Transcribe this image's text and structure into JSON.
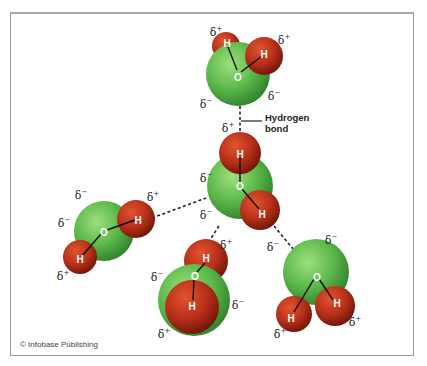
{
  "diagram": {
    "annotation": {
      "line1": "Hydrogen",
      "line2": "bond"
    },
    "credit": "© Infobase Publishing",
    "colors": {
      "oxygen": "#5cb84a",
      "hydrogen": "#b8301a",
      "bond_line": "#222222",
      "frame": "#9a9a9a"
    },
    "symbols": {
      "oxygen": "O",
      "hydrogen": "H",
      "delta_plus": "δ+",
      "delta_minus": "δ−"
    },
    "molecules": [
      {
        "id": "top",
        "atoms": [
          "O",
          "H",
          "H"
        ],
        "charges": [
          "δ+",
          "δ+",
          "δ−",
          "δ−"
        ]
      },
      {
        "id": "center",
        "atoms": [
          "O",
          "H",
          "H"
        ],
        "charges": [
          "δ+",
          "δ−",
          "δ−"
        ]
      },
      {
        "id": "left",
        "atoms": [
          "O",
          "H",
          "H"
        ],
        "charges": [
          "δ−",
          "δ+",
          "δ−",
          "δ+"
        ]
      },
      {
        "id": "bottom",
        "atoms": [
          "O",
          "H",
          "H"
        ],
        "charges": [
          "δ−",
          "δ+",
          "δ−",
          "δ+"
        ]
      },
      {
        "id": "right",
        "atoms": [
          "O",
          "H",
          "H"
        ],
        "charges": [
          "δ−",
          "δ−",
          "δ+",
          "δ+"
        ]
      }
    ]
  }
}
